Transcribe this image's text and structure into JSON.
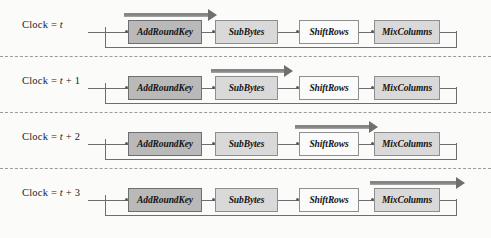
{
  "diagram": {
    "stage_names": [
      "AddRoundKey",
      "SubBytes",
      "ShiftRows",
      "MixColumns"
    ],
    "colors": {
      "background": "#fbfbfa",
      "stage_dark_fill": "#b9b9b9",
      "stage_mid_fill": "#d9d9d9",
      "stage_light_fill": "#fbfbfb",
      "stage_border": "#8a8a8a",
      "wire": "#6e6e6e",
      "highlight_arrow": "#7e7e7e",
      "divider": "#9a9a9a",
      "text": "#141414"
    },
    "rows": [
      {
        "label_prefix": "Clock = ",
        "label_var": "t",
        "label_suffix": "",
        "active_stage_index": 0,
        "stages": [
          {
            "name": "AddRoundKey",
            "fill": "dark"
          },
          {
            "name": "SubBytes",
            "fill": "mid"
          },
          {
            "name": "ShiftRows",
            "fill": "light"
          },
          {
            "name": "MixColumns",
            "fill": "mid"
          }
        ],
        "highlight": {
          "left": 124,
          "width": 86,
          "head_left": 208
        }
      },
      {
        "label_prefix": "Clock = ",
        "label_var": "t",
        "label_suffix": " + 1",
        "active_stage_index": 1,
        "stages": [
          {
            "name": "AddRoundKey",
            "fill": "dark"
          },
          {
            "name": "SubBytes",
            "fill": "mid"
          },
          {
            "name": "ShiftRows",
            "fill": "light"
          },
          {
            "name": "MixColumns",
            "fill": "mid"
          }
        ],
        "highlight": {
          "left": 211,
          "width": 75,
          "head_left": 284
        }
      },
      {
        "label_prefix": "Clock = ",
        "label_var": "t",
        "label_suffix": " + 2",
        "active_stage_index": 2,
        "stages": [
          {
            "name": "AddRoundKey",
            "fill": "dark"
          },
          {
            "name": "SubBytes",
            "fill": "mid"
          },
          {
            "name": "ShiftRows",
            "fill": "light"
          },
          {
            "name": "MixColumns",
            "fill": "mid"
          }
        ],
        "highlight": {
          "left": 295,
          "width": 76,
          "head_left": 369
        }
      },
      {
        "label_prefix": "Clock = ",
        "label_var": "t",
        "label_suffix": " + 3",
        "active_stage_index": 3,
        "stages": [
          {
            "name": "AddRoundKey",
            "fill": "dark"
          },
          {
            "name": "SubBytes",
            "fill": "mid"
          },
          {
            "name": "ShiftRows",
            "fill": "light"
          },
          {
            "name": "MixColumns",
            "fill": "mid"
          }
        ],
        "highlight": {
          "left": 370,
          "width": 88,
          "head_left": 456
        }
      }
    ]
  }
}
